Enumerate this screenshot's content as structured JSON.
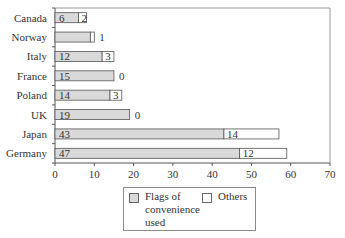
{
  "chart_data": {
    "type": "bar",
    "orientation": "horizontal",
    "stacked": true,
    "categories": [
      "Canada",
      "Norway",
      "Italy",
      "France",
      "Poland",
      "UK",
      "Japan",
      "Germany"
    ],
    "series": [
      {
        "name": "Flags of convenience used",
        "color": "#d9d9d9",
        "values": [
          6,
          9,
          12,
          15,
          14,
          19,
          43,
          47
        ],
        "labels": [
          "6",
          "",
          "12",
          "15",
          "14",
          "19",
          "43",
          "47"
        ]
      },
      {
        "name": "Others",
        "color": "#ffffff",
        "values": [
          2,
          1,
          3,
          0,
          3,
          0,
          14,
          12
        ],
        "labels": [
          "2",
          "1",
          "3",
          "0",
          "3",
          "0",
          "14",
          "12"
        ]
      }
    ],
    "title": "",
    "xlabel": "",
    "ylabel": "",
    "xlim": [
      0,
      70
    ],
    "xticks": [
      0,
      10,
      20,
      30,
      40,
      50,
      60,
      70
    ],
    "grid": false,
    "legend_position": "bottom"
  },
  "legend": {
    "flags_label_line1": "Flags of",
    "flags_label_line2": "convenience",
    "flags_label_line3": "used",
    "others_label": "Others"
  }
}
